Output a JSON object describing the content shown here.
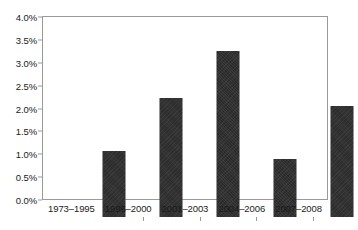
{
  "chart_data": {
    "type": "bar",
    "title": "",
    "subtitle": "",
    "xlabel": "",
    "ylabel": "",
    "categories": [
      "1973–1995",
      "1996–2000",
      "2001–2003",
      "2004–2006",
      "2007–2008"
    ],
    "values": [
      1.45,
      2.61,
      3.62,
      1.26,
      2.43
    ],
    "value_format": "percent",
    "ylim": [
      0.0,
      4.0
    ],
    "ytick_values": [
      0.0,
      0.5,
      1.0,
      1.5,
      2.0,
      2.5,
      3.0,
      3.5,
      4.0
    ],
    "ytick_labels": [
      "0.0%",
      "0.5%",
      "1.0%",
      "1.5%",
      "2.0%",
      "2.5%",
      "3.0%",
      "3.5%",
      "4.0%"
    ],
    "grid": false,
    "legend": false,
    "legend_position": "none",
    "bar_color": "#2b2b2b",
    "frame_color": "#9a9a9a",
    "background_color": "#ffffff",
    "text_color": "#1a1a1a"
  }
}
